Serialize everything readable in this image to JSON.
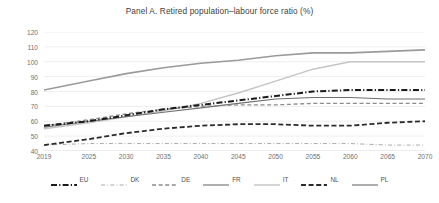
{
  "chart_data": {
    "type": "line",
    "title": "Panel A. Retired population–labour force ratio (%)",
    "xlabel": "",
    "ylabel": "",
    "ylim": [
      40,
      120
    ],
    "ytick_step": 10,
    "yticks": [
      40,
      50,
      60,
      70,
      80,
      90,
      100,
      110,
      120
    ],
    "x": [
      2019,
      2025,
      2030,
      2035,
      2040,
      2045,
      2050,
      2055,
      2060,
      2065,
      2070
    ],
    "categories": [
      "2019",
      "2025",
      "2030",
      "2035",
      "2040",
      "2045",
      "2050",
      "2055",
      "2060",
      "2065",
      "2070"
    ],
    "grid": true,
    "legend_position": "bottom",
    "series": [
      {
        "name": "EU",
        "color": "#1a1a1a",
        "style": "dash-dot",
        "width": 2.0,
        "values": [
          57,
          60,
          64,
          68,
          71,
          74,
          77,
          80,
          81,
          81,
          81
        ]
      },
      {
        "name": "DK",
        "color": "#aaaaaa",
        "style": "dash-dot",
        "width": 1.0,
        "values": [
          44,
          45,
          45,
          45,
          45,
          45,
          45,
          45,
          45,
          44,
          44
        ]
      },
      {
        "name": "DE",
        "color": "#8c8c8c",
        "style": "dashed",
        "width": 1.3,
        "values": [
          57,
          61,
          65,
          68,
          70,
          71,
          71,
          72,
          72,
          72,
          72
        ]
      },
      {
        "name": "FR",
        "color": "#6e6e6e",
        "style": "solid",
        "width": 1.1,
        "values": [
          56,
          60,
          63,
          66,
          69,
          72,
          75,
          76,
          76,
          75,
          75
        ]
      },
      {
        "name": "IT",
        "color": "#c4c4c4",
        "style": "solid",
        "width": 1.4,
        "values": [
          55,
          59,
          63,
          67,
          72,
          79,
          87,
          95,
          100,
          100,
          100
        ]
      },
      {
        "name": "NL",
        "color": "#2b2b2b",
        "style": "dashed",
        "width": 1.8,
        "values": [
          44,
          48,
          52,
          55,
          57,
          58,
          58,
          57,
          57,
          59,
          60
        ]
      },
      {
        "name": "PL",
        "color": "#9a9a9a",
        "style": "solid",
        "width": 1.6,
        "values": [
          81,
          87,
          92,
          96,
          99,
          101,
          104,
          106,
          106,
          107,
          108
        ]
      }
    ]
  }
}
